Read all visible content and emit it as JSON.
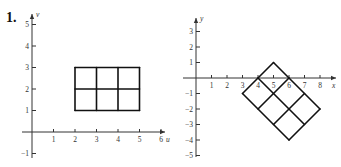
{
  "problem": {
    "number": "1."
  },
  "chart_data": [
    {
      "type": "diagram",
      "title": "Original region in uv-plane",
      "xlabel": "u",
      "ylabel": "v",
      "x_ticks": [
        1,
        2,
        3,
        4,
        5,
        6
      ],
      "y_ticks": [
        -1,
        1,
        2,
        3,
        4,
        5
      ],
      "xlim": [
        0,
        6.5
      ],
      "ylim": [
        -1,
        5.5
      ],
      "grid_region": {
        "u_range": [
          2,
          5
        ],
        "v_range": [
          1,
          3
        ],
        "u_lines": [
          2,
          3,
          4,
          5
        ],
        "v_lines": [
          1,
          2,
          3
        ]
      }
    },
    {
      "type": "diagram",
      "title": "Transformed region in xy-plane",
      "xlabel": "x",
      "ylabel": "y",
      "x_ticks": [
        1,
        2,
        3,
        4,
        5,
        6,
        7,
        8
      ],
      "y_ticks": [
        -5,
        -4,
        -3,
        -2,
        -1,
        1,
        2,
        3
      ],
      "xlim": [
        0,
        8.5
      ],
      "ylim": [
        -5,
        3.5
      ],
      "corners": [
        [
          3,
          -1
        ],
        [
          5,
          1
        ],
        [
          8,
          -2
        ],
        [
          6,
          -4
        ]
      ],
      "lines": [
        [
          [
            3,
            -1
          ],
          [
            6,
            -4
          ]
        ],
        [
          [
            4,
            0
          ],
          [
            7,
            -3
          ]
        ],
        [
          [
            5,
            1
          ],
          [
            8,
            -2
          ]
        ],
        [
          [
            3,
            -1
          ],
          [
            5,
            1
          ]
        ],
        [
          [
            4,
            -2
          ],
          [
            6,
            0
          ]
        ],
        [
          [
            5,
            -3
          ],
          [
            7,
            -1
          ]
        ],
        [
          [
            6,
            -4
          ],
          [
            8,
            -2
          ]
        ]
      ]
    }
  ],
  "left": {
    "origin": [
      32,
      132
    ],
    "unit": 21.5,
    "xlabel": "u",
    "ylabel": "v",
    "xticks": [
      "1",
      "2",
      "3",
      "4",
      "5",
      "6"
    ],
    "yticks": [
      "-1",
      "1",
      "2",
      "3",
      "4",
      "5"
    ]
  },
  "right": {
    "origin": [
      196,
      78
    ],
    "unit": 15.5,
    "xlabel": "x",
    "ylabel": "y",
    "xticks": [
      "1",
      "2",
      "3",
      "4",
      "5",
      "6",
      "7",
      "8"
    ],
    "yticks": [
      "-5",
      "-4",
      "-3",
      "-2",
      "-1",
      "1",
      "2",
      "3"
    ]
  }
}
